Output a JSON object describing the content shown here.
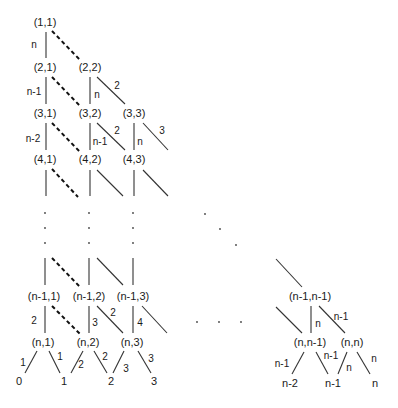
{
  "diagram": {
    "type": "lattice-tree",
    "nodes": [
      {
        "id": "n11",
        "label": "(1,1)",
        "x": 45,
        "y": 26
      },
      {
        "id": "n21",
        "label": "(2,1)",
        "x": 45,
        "y": 71
      },
      {
        "id": "n22",
        "label": "(2,2)",
        "x": 90,
        "y": 71
      },
      {
        "id": "n31",
        "label": "(3,1)",
        "x": 45,
        "y": 117
      },
      {
        "id": "n32",
        "label": "(3,2)",
        "x": 90,
        "y": 117
      },
      {
        "id": "n33",
        "label": "(3,3)",
        "x": 134,
        "y": 117
      },
      {
        "id": "n41",
        "label": "(4,1)",
        "x": 45,
        "y": 163
      },
      {
        "id": "n42",
        "label": "(4,2)",
        "x": 90,
        "y": 163
      },
      {
        "id": "n43",
        "label": "(4,3)",
        "x": 134,
        "y": 163
      },
      {
        "id": "nm11",
        "label": "(n-1,1)",
        "x": 44,
        "y": 300
      },
      {
        "id": "nm12",
        "label": "(n-1,2)",
        "x": 89,
        "y": 300
      },
      {
        "id": "nm13",
        "label": "(n-1,3)",
        "x": 133,
        "y": 300
      },
      {
        "id": "nmm",
        "label": "(n-1,n-1)",
        "x": 310,
        "y": 300
      },
      {
        "id": "nn1",
        "label": "(n,1)",
        "x": 43,
        "y": 346
      },
      {
        "id": "nn2",
        "label": "(n,2)",
        "x": 88,
        "y": 346
      },
      {
        "id": "nn3",
        "label": "(n,3)",
        "x": 132,
        "y": 346
      },
      {
        "id": "nnm",
        "label": "(n,n-1)",
        "x": 310,
        "y": 346
      },
      {
        "id": "nnn",
        "label": "(n,n)",
        "x": 352,
        "y": 346
      }
    ],
    "leaves": [
      {
        "label": "0",
        "x": 19,
        "y": 385
      },
      {
        "label": "1",
        "x": 64,
        "y": 385
      },
      {
        "label": "2",
        "x": 111,
        "y": 385
      },
      {
        "label": "3",
        "x": 154,
        "y": 385
      },
      {
        "label": "n-2",
        "x": 290,
        "y": 387
      },
      {
        "label": "n-1",
        "x": 333,
        "y": 387
      },
      {
        "label": "n",
        "x": 375,
        "y": 387
      }
    ],
    "edge_labels": [
      {
        "label": "n",
        "x": 34,
        "y": 48
      },
      {
        "label": "n-1",
        "x": 34,
        "y": 95
      },
      {
        "label": "n",
        "x": 97,
        "y": 98
      },
      {
        "label": "2",
        "x": 117,
        "y": 89
      },
      {
        "label": "n-2",
        "x": 33,
        "y": 142
      },
      {
        "label": "n-1",
        "x": 99,
        "y": 145
      },
      {
        "label": "2",
        "x": 117,
        "y": 134
      },
      {
        "label": "n",
        "x": 140,
        "y": 145
      },
      {
        "label": "3",
        "x": 162,
        "y": 134
      },
      {
        "label": "2",
        "x": 34,
        "y": 324
      },
      {
        "label": "3",
        "x": 95,
        "y": 326
      },
      {
        "label": "2",
        "x": 113,
        "y": 316
      },
      {
        "label": "4",
        "x": 140,
        "y": 326
      },
      {
        "label": "1",
        "x": 23,
        "y": 366
      },
      {
        "label": "1",
        "x": 60,
        "y": 360
      },
      {
        "label": "2",
        "x": 81,
        "y": 368
      },
      {
        "label": "2",
        "x": 105,
        "y": 360
      },
      {
        "label": "3",
        "x": 126,
        "y": 372
      },
      {
        "label": "3",
        "x": 151,
        "y": 362
      },
      {
        "label": "n",
        "x": 318,
        "y": 327
      },
      {
        "label": "n-1",
        "x": 340,
        "y": 320
      },
      {
        "label": "n-1",
        "x": 282,
        "y": 367
      },
      {
        "label": "n-1",
        "x": 330,
        "y": 359
      },
      {
        "label": "n",
        "x": 349,
        "y": 371
      },
      {
        "label": "n",
        "x": 373,
        "y": 362
      }
    ],
    "ellipsis_marks": "vertical dots in columns 1-3, diagonal dots toward (n-1,n-1), horizontal dots between (n-1,3) and (n-1,n-1)"
  }
}
